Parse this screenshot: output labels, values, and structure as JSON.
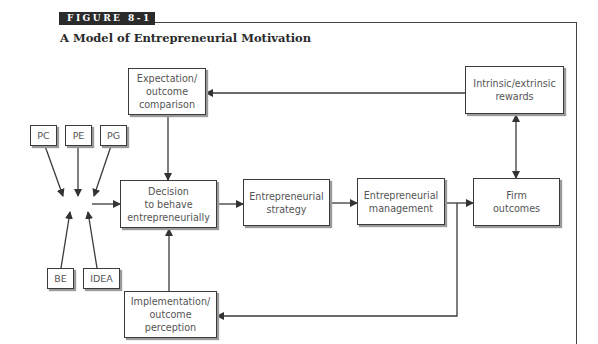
{
  "figure": {
    "label": "FIGURE 8-1",
    "title": "A Model of Entrepreneurial Motivation"
  },
  "nodes": {
    "pc": "PC",
    "pe": "PE",
    "pg": "PG",
    "be": "BE",
    "idea": "IDEA",
    "expectation": "Expectation/\noutcome\ncomparison",
    "decision": "Decision\nto behave\nentrepreneurially",
    "strategy": "Entrepreneurial\nstrategy",
    "management": "Entrepreneurial\nmanagement",
    "firm_outcomes": "Firm\noutcomes",
    "rewards": "Intrinsic/extrinsic\nrewards",
    "implementation": "Implementation/\noutcome\nperception"
  },
  "edges": [
    {
      "from": "pc",
      "to": "decision"
    },
    {
      "from": "pe",
      "to": "decision"
    },
    {
      "from": "pg",
      "to": "decision"
    },
    {
      "from": "be",
      "to": "decision"
    },
    {
      "from": "idea",
      "to": "decision"
    },
    {
      "from": "expectation",
      "to": "decision"
    },
    {
      "from": "implementation",
      "to": "decision"
    },
    {
      "from": "decision",
      "to": "strategy"
    },
    {
      "from": "strategy",
      "to": "management"
    },
    {
      "from": "management",
      "to": "firm_outcomes"
    },
    {
      "from": "management",
      "to": "implementation"
    },
    {
      "from": "firm_outcomes",
      "to": "rewards",
      "bidirectional": true
    },
    {
      "from": "rewards",
      "to": "expectation"
    }
  ],
  "colors": {
    "label_bg": "#2b2b2b",
    "line": "#3a3a3a",
    "text": "#555555"
  }
}
